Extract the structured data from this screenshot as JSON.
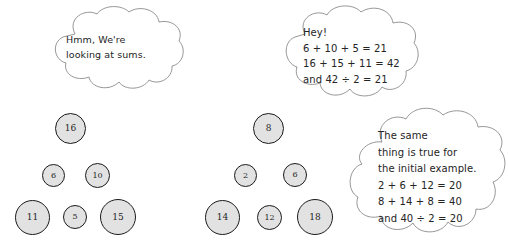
{
  "speech_bubbles": [
    {
      "id": "hmm",
      "name": "speech-bubble-hmm",
      "text": "Hmm, We're\nlooking at sums."
    },
    {
      "id": "hey",
      "name": "speech-bubble-hey",
      "text": "Hey!\n6 + 10 + 5 = 21\n16 + 15 + 11 = 42\nand 42 ÷ 2 = 21"
    },
    {
      "id": "same",
      "name": "speech-bubble-same",
      "text": "The same\nthing is true for\nthe initial example.\n2 + 6 + 12 = 20\n8 + 14 + 8 = 40\nand 40 ÷ 2 = 20"
    }
  ],
  "colors": {
    "circle_fill": "#e2e2e2",
    "circle_border": "#1b1b1b",
    "cloud_outline": "#8a8a8a",
    "text": "#242424",
    "background": "#ffffff"
  },
  "diagrams": [
    {
      "id": "left-pyramid",
      "name": "number-pyramid-left",
      "nodes": [
        {
          "label": "16",
          "x": 55,
          "y": 113,
          "size": 31
        },
        {
          "label": "6",
          "x": 42,
          "y": 164,
          "size": 23
        },
        {
          "label": "10",
          "x": 85,
          "y": 163,
          "size": 25
        },
        {
          "label": "11",
          "x": 15,
          "y": 200,
          "size": 35
        },
        {
          "label": "5",
          "x": 63,
          "y": 205,
          "size": 24
        },
        {
          "label": "15",
          "x": 100,
          "y": 199,
          "size": 36
        }
      ]
    },
    {
      "id": "right-pyramid",
      "name": "number-pyramid-right",
      "nodes": [
        {
          "label": "8",
          "x": 253,
          "y": 113,
          "size": 31
        },
        {
          "label": "2",
          "x": 234,
          "y": 164,
          "size": 23
        },
        {
          "label": "6",
          "x": 283,
          "y": 163,
          "size": 24
        },
        {
          "label": "14",
          "x": 205,
          "y": 200,
          "size": 35
        },
        {
          "label": "12",
          "x": 257,
          "y": 205,
          "size": 25
        },
        {
          "label": "18",
          "x": 297,
          "y": 199,
          "size": 36
        }
      ]
    }
  ]
}
